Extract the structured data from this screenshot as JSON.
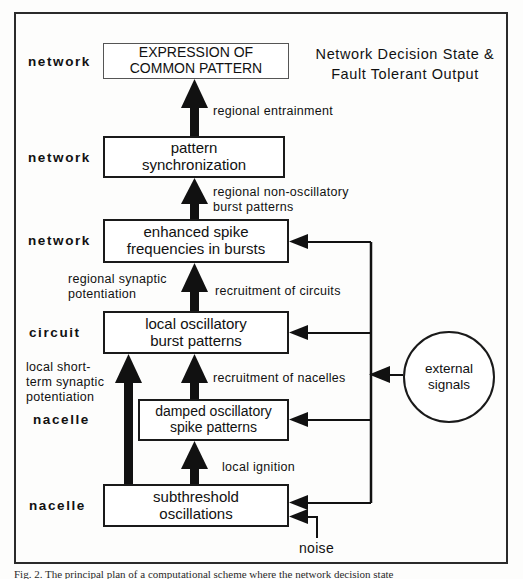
{
  "figure": {
    "title_right": [
      "Network Decision State &",
      "Fault Tolerant Output"
    ],
    "caption": "Fig. 2.  The principal plan of a computational scheme where the network decision state"
  },
  "level_labels": [
    {
      "id": "network-1",
      "text": "network"
    },
    {
      "id": "network-2",
      "text": "network"
    },
    {
      "id": "network-3",
      "text": "network"
    },
    {
      "id": "circuit",
      "text": "circuit"
    },
    {
      "id": "nacelle-1",
      "text": "nacelle"
    },
    {
      "id": "nacelle-2",
      "text": "nacelle"
    }
  ],
  "nodes": [
    {
      "id": "expression",
      "lines": [
        "EXPRESSION OF",
        "COMMON PATTERN"
      ]
    },
    {
      "id": "pattern-sync",
      "lines": [
        "pattern",
        "synchronization"
      ]
    },
    {
      "id": "enhanced",
      "lines": [
        "enhanced spike",
        "frequencies  in  bursts"
      ]
    },
    {
      "id": "local-osc",
      "lines": [
        "local  oscillatory",
        "burst  patterns"
      ]
    },
    {
      "id": "damped",
      "lines": [
        "damped  oscillatory",
        "spike  patterns"
      ]
    },
    {
      "id": "subthreshold",
      "lines": [
        "subthreshold",
        "oscillations"
      ]
    },
    {
      "id": "external",
      "lines": [
        "external",
        "signals"
      ]
    }
  ],
  "edge_labels": [
    {
      "id": "regional-entrainment",
      "lines": [
        "regional  entrainment"
      ]
    },
    {
      "id": "regional-nonosc",
      "lines": [
        "regional  non-oscillatory",
        "burst  patterns"
      ]
    },
    {
      "id": "regional-synaptic",
      "lines": [
        "regional synaptic",
        "potentiation"
      ]
    },
    {
      "id": "recruitment-circuits",
      "lines": [
        "recruitment  of  circuits"
      ]
    },
    {
      "id": "local-shortterm",
      "lines": [
        "local  short-",
        "term  synaptic",
        "potentiation"
      ]
    },
    {
      "id": "recruitment-nacelles",
      "lines": [
        "recruitment  of  nacelles"
      ]
    },
    {
      "id": "local-ignition",
      "lines": [
        "local  ignition"
      ]
    },
    {
      "id": "noise",
      "lines": [
        "noise"
      ]
    }
  ],
  "colors": {
    "ink": "#111111",
    "frame": "#2b2b2b",
    "paper": "#fdfdfc"
  }
}
